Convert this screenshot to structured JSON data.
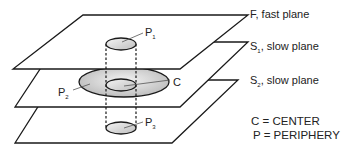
{
  "planes": [
    {
      "label": "F, fast plane",
      "name": "F",
      "subscript": "",
      "rest": ", fast plane"
    },
    {
      "label": "S1, slow plane",
      "name": "S",
      "subscript": "1",
      "rest": ", slow plane"
    },
    {
      "label": "S2, slow plane",
      "name": "S",
      "subscript": "2",
      "rest": ", slow plane"
    }
  ],
  "points": [
    {
      "name": "P",
      "subscript": "1"
    },
    {
      "name": "P",
      "subscript": "2"
    },
    {
      "name": "P",
      "subscript": "3"
    },
    {
      "name": "C",
      "subscript": ""
    }
  ],
  "legend": [
    {
      "text": "C = CENTER"
    },
    {
      "text": "P = PERIPHERY"
    }
  ],
  "colors": {
    "line": "#1a1a1a",
    "fill_light": "#f2f2f2",
    "fill_dark": "#bdbdbd"
  }
}
